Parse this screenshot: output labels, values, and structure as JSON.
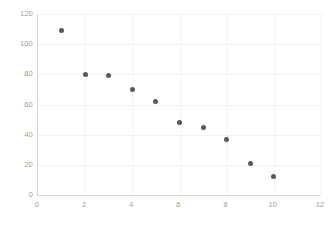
{
  "chart_data": {
    "type": "scatter",
    "title": "",
    "subtitle": "",
    "xlabel": "",
    "ylabel": "",
    "xlim": [
      0,
      12
    ],
    "ylim": [
      0,
      120
    ],
    "xticks": [
      0,
      2,
      4,
      6,
      8,
      10,
      12
    ],
    "yticks": [
      0,
      20,
      40,
      60,
      80,
      100,
      120
    ],
    "grid": true,
    "legend": null,
    "legend_position": "none",
    "annotations": [],
    "series": [
      {
        "name": "series-1",
        "marker": "circle",
        "color": "#595959",
        "x": [
          1,
          2,
          3,
          4,
          5,
          6,
          7,
          8,
          9,
          10
        ],
        "values": [
          109,
          80,
          79,
          70,
          62,
          48,
          45,
          37,
          21,
          12
        ],
        "points": [
          {
            "x": 1,
            "y": 109
          },
          {
            "x": 2,
            "y": 80
          },
          {
            "x": 3,
            "y": 79
          },
          {
            "x": 4,
            "y": 70
          },
          {
            "x": 5,
            "y": 62
          },
          {
            "x": 6,
            "y": 48
          },
          {
            "x": 7,
            "y": 45
          },
          {
            "x": 8,
            "y": 37
          },
          {
            "x": 9,
            "y": 21
          },
          {
            "x": 10,
            "y": 12
          }
        ]
      }
    ],
    "colors": {
      "marker": "#595959",
      "gridline": "#f2f2f2",
      "axis": "#d9d9d9",
      "tick_label": "#9b9b9b",
      "background": "#ffffff"
    }
  }
}
